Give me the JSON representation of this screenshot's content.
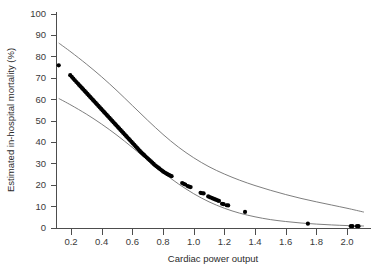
{
  "chart_data": {
    "type": "scatter",
    "title": "",
    "xlabel": "Cardiac power output",
    "ylabel": "Estimated in-hospital mortality (%)",
    "xlim": [
      0.1,
      2.12
    ],
    "ylim": [
      0,
      100
    ],
    "grid": false,
    "legend": null,
    "xticks": [
      0.2,
      0.4,
      0.6,
      0.8,
      1.0,
      1.2,
      1.4,
      1.6,
      1.8,
      2.0
    ],
    "xtick_labels": [
      "0.2",
      "0.4",
      "0.6",
      "0.8",
      "1.0",
      "1.2",
      "1.4",
      "1.6",
      "1.8",
      "2.0"
    ],
    "yticks": [
      0,
      10,
      20,
      30,
      40,
      50,
      60,
      70,
      80,
      90,
      100
    ],
    "ytick_labels": [
      "0",
      "10",
      "20",
      "30",
      "40",
      "50",
      "60",
      "70",
      "80",
      "90",
      "100"
    ],
    "series": [
      {
        "name": "Estimated in-hospital mortality",
        "type": "scatter",
        "marker": "filled-circle",
        "color": "#000000",
        "points": [
          [
            0.12,
            75.8
          ],
          [
            0.195,
            71.2
          ],
          [
            0.205,
            70.4
          ],
          [
            0.215,
            69.6
          ],
          [
            0.225,
            68.8
          ],
          [
            0.235,
            68.0
          ],
          [
            0.245,
            67.3
          ],
          [
            0.253,
            66.6
          ],
          [
            0.262,
            65.9
          ],
          [
            0.271,
            65.2
          ],
          [
            0.28,
            64.5
          ],
          [
            0.289,
            63.8
          ],
          [
            0.298,
            63.1
          ],
          [
            0.307,
            62.4
          ],
          [
            0.316,
            61.7
          ],
          [
            0.325,
            61.0
          ],
          [
            0.334,
            60.3
          ],
          [
            0.343,
            59.6
          ],
          [
            0.352,
            58.9
          ],
          [
            0.361,
            58.2
          ],
          [
            0.37,
            57.5
          ],
          [
            0.379,
            56.8
          ],
          [
            0.388,
            56.1
          ],
          [
            0.397,
            55.4
          ],
          [
            0.406,
            54.7
          ],
          [
            0.415,
            54.0
          ],
          [
            0.424,
            53.3
          ],
          [
            0.433,
            52.6
          ],
          [
            0.442,
            51.9
          ],
          [
            0.451,
            51.2
          ],
          [
            0.46,
            50.5
          ],
          [
            0.469,
            49.8
          ],
          [
            0.478,
            49.1
          ],
          [
            0.487,
            48.4
          ],
          [
            0.496,
            47.7
          ],
          [
            0.505,
            47.0
          ],
          [
            0.514,
            46.3
          ],
          [
            0.523,
            45.6
          ],
          [
            0.532,
            44.9
          ],
          [
            0.541,
            44.2
          ],
          [
            0.55,
            43.5
          ],
          [
            0.559,
            42.8
          ],
          [
            0.568,
            42.1
          ],
          [
            0.577,
            41.4
          ],
          [
            0.586,
            40.7
          ],
          [
            0.595,
            40.0
          ],
          [
            0.604,
            39.3
          ],
          [
            0.613,
            38.6
          ],
          [
            0.622,
            37.9
          ],
          [
            0.631,
            37.2
          ],
          [
            0.64,
            36.5
          ],
          [
            0.649,
            35.8
          ],
          [
            0.658,
            35.1
          ],
          [
            0.667,
            34.5
          ],
          [
            0.676,
            33.9
          ],
          [
            0.685,
            33.3
          ],
          [
            0.694,
            32.7
          ],
          [
            0.703,
            32.1
          ],
          [
            0.712,
            31.5
          ],
          [
            0.721,
            30.9
          ],
          [
            0.73,
            30.3
          ],
          [
            0.739,
            29.7
          ],
          [
            0.748,
            29.1
          ],
          [
            0.757,
            28.6
          ],
          [
            0.766,
            28.1
          ],
          [
            0.775,
            27.6
          ],
          [
            0.784,
            27.1
          ],
          [
            0.793,
            26.6
          ],
          [
            0.802,
            26.1
          ],
          [
            0.811,
            25.7
          ],
          [
            0.82,
            25.3
          ],
          [
            0.829,
            24.9
          ],
          [
            0.838,
            24.6
          ],
          [
            0.847,
            24.3
          ],
          [
            0.856,
            24.0
          ],
          [
            0.925,
            20.8
          ],
          [
            0.935,
            20.4
          ],
          [
            0.945,
            20.1
          ],
          [
            0.96,
            19.4
          ],
          [
            0.97,
            19.1
          ],
          [
            0.98,
            18.9
          ],
          [
            1.045,
            16.2
          ],
          [
            1.055,
            16.0
          ],
          [
            1.065,
            15.9
          ],
          [
            1.095,
            14.5
          ],
          [
            1.105,
            14.2
          ],
          [
            1.115,
            13.9
          ],
          [
            1.125,
            13.6
          ],
          [
            1.135,
            13.3
          ],
          [
            1.145,
            13.0
          ],
          [
            1.155,
            12.7
          ],
          [
            1.165,
            12.4
          ],
          [
            1.185,
            11.1
          ],
          [
            1.195,
            10.9
          ],
          [
            1.215,
            10.4
          ],
          [
            1.225,
            10.3
          ],
          [
            1.335,
            7.3
          ],
          [
            1.745,
            1.8
          ],
          [
            2.025,
            0.6
          ],
          [
            2.035,
            0.6
          ],
          [
            2.065,
            0.6
          ],
          [
            2.075,
            0.6
          ]
        ]
      },
      {
        "name": "Upper 95% confidence limit",
        "type": "line",
        "color": "#6f6f6f",
        "points": [
          [
            0.12,
            86.2
          ],
          [
            0.2,
            82.0
          ],
          [
            0.3,
            76.4
          ],
          [
            0.4,
            70.4
          ],
          [
            0.5,
            63.9
          ],
          [
            0.6,
            57.0
          ],
          [
            0.7,
            50.1
          ],
          [
            0.8,
            43.5
          ],
          [
            0.9,
            37.6
          ],
          [
            1.0,
            32.6
          ],
          [
            1.1,
            28.4
          ],
          [
            1.2,
            25.0
          ],
          [
            1.3,
            22.1
          ],
          [
            1.4,
            19.6
          ],
          [
            1.5,
            17.4
          ],
          [
            1.6,
            15.4
          ],
          [
            1.7,
            13.6
          ],
          [
            1.8,
            12.0
          ],
          [
            1.9,
            10.5
          ],
          [
            2.0,
            9.0
          ],
          [
            2.11,
            7.2
          ]
        ]
      },
      {
        "name": "Lower 95% confidence limit",
        "type": "line",
        "color": "#6f6f6f",
        "points": [
          [
            0.12,
            60.3
          ],
          [
            0.2,
            57.2
          ],
          [
            0.3,
            53.0
          ],
          [
            0.4,
            48.3
          ],
          [
            0.5,
            43.1
          ],
          [
            0.6,
            37.4
          ],
          [
            0.7,
            31.5
          ],
          [
            0.8,
            25.7
          ],
          [
            0.9,
            20.4
          ],
          [
            1.0,
            15.8
          ],
          [
            1.1,
            12.0
          ],
          [
            1.2,
            9.0
          ],
          [
            1.3,
            6.7
          ],
          [
            1.4,
            5.0
          ],
          [
            1.5,
            3.7
          ],
          [
            1.6,
            2.8
          ],
          [
            1.7,
            2.1
          ],
          [
            1.8,
            1.6
          ],
          [
            1.9,
            1.2
          ],
          [
            2.0,
            0.9
          ],
          [
            2.11,
            0.7
          ]
        ]
      }
    ]
  },
  "axes": {
    "x_title": "Cardiac power output",
    "y_title": "Estimated in-hospital mortality (%)"
  }
}
